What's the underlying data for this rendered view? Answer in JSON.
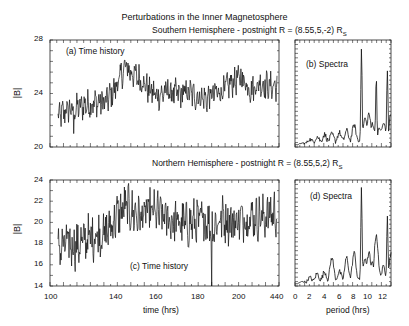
{
  "figure": {
    "title": "Perturbations in the Inner Magnetosphere",
    "south_subtitle": "Southern Hemisphere - postnight R = (8.55,5,-2) R",
    "north_subtitle": "Northern Hemisphere - postnight R = (8.55,5,2) R",
    "subscript": "S"
  },
  "chart_data": [
    {
      "id": "a",
      "type": "line",
      "title": "(a) Time history",
      "xlabel": "",
      "ylabel": "|B|",
      "ylim": [
        20,
        28
      ],
      "yticks": [
        "20",
        "24",
        "28"
      ],
      "xlim": [
        100,
        440
      ],
      "grid": false,
      "series": [
        {
          "name": "|B| south",
          "x": [
            104,
            110,
            116,
            122,
            128,
            134,
            140,
            146,
            150,
            156,
            160,
            166,
            172,
            178,
            184,
            190,
            196,
            200,
            206,
            212,
            218,
            224,
            230,
            236,
            240
          ],
          "values": [
            22.2,
            22.8,
            22.9,
            23.2,
            23.3,
            23.4,
            24.5,
            26.0,
            25.5,
            25.0,
            24.3,
            23.8,
            24.2,
            23.9,
            24.1,
            23.8,
            23.6,
            23.9,
            24.2,
            24.8,
            25.2,
            24.3,
            24.8,
            24.5,
            24.6
          ]
        }
      ]
    },
    {
      "id": "b",
      "type": "line",
      "title": "(b) Spectra",
      "xlabel": "",
      "ylabel": "",
      "xlim": [
        0,
        13
      ],
      "grid": false,
      "series": [
        {
          "name": "power south",
          "x": [
            0,
            1,
            2,
            3,
            4,
            5,
            6,
            7,
            8,
            9,
            9.5,
            10,
            10.5,
            11,
            11.5,
            12,
            12.5,
            13
          ],
          "values": [
            0,
            0.01,
            0.04,
            0.06,
            0.08,
            0.08,
            0.1,
            0.12,
            0.18,
            1.0,
            0.25,
            0.3,
            0.2,
            0.7,
            0.15,
            0.2,
            0.78,
            0.3
          ]
        }
      ]
    },
    {
      "id": "c",
      "type": "line",
      "title": "(c) Time history",
      "xlabel": "time (hrs)",
      "ylabel": "|B|",
      "ylim": [
        14,
        24
      ],
      "yticks": [
        "14",
        "16",
        "18",
        "20",
        "22",
        "24"
      ],
      "xticks": [
        "100",
        "140",
        "160",
        "180",
        "200",
        "440"
      ],
      "grid": false,
      "series": [
        {
          "name": "|B| north",
          "x": [
            104,
            110,
            116,
            122,
            128,
            134,
            140,
            146,
            150,
            156,
            160,
            166,
            172,
            178,
            184,
            190,
            196,
            200,
            206,
            212,
            218,
            224,
            230,
            236,
            240
          ],
          "values": [
            17.5,
            18.0,
            17.8,
            18.5,
            18.8,
            19.0,
            20.5,
            21.5,
            21.0,
            20.5,
            21.0,
            20.8,
            20.3,
            20.0,
            19.8,
            20.0,
            20.2,
            19.5,
            20.5,
            20.0,
            20.3,
            20.6,
            20.4,
            20.8,
            21.0
          ]
        }
      ]
    },
    {
      "id": "d",
      "type": "line",
      "title": "(d) Spectra",
      "xlabel": "period (hrs)",
      "ylabel": "",
      "xlim": [
        0,
        13
      ],
      "xticks": [
        "0",
        "2",
        "4",
        "6",
        "8",
        "10",
        "12"
      ],
      "grid": false,
      "series": [
        {
          "name": "power north",
          "x": [
            0,
            1,
            2,
            3,
            4,
            5,
            6,
            7,
            8,
            9,
            9.5,
            10,
            10.5,
            11,
            11.5,
            12,
            12.5,
            13
          ],
          "values": [
            0,
            0.02,
            0.05,
            0.08,
            0.1,
            0.25,
            0.1,
            0.25,
            0.3,
            1.0,
            0.25,
            0.3,
            0.2,
            0.5,
            0.1,
            0.15,
            0.72,
            0.3
          ]
        }
      ]
    }
  ]
}
